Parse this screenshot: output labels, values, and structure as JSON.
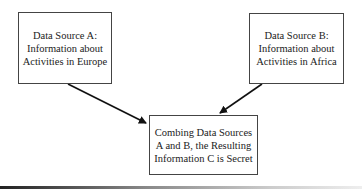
{
  "diagram": {
    "nodes": [
      {
        "id": "A",
        "lines": [
          "Data Source A:",
          "Information about",
          "Activities in Europe"
        ]
      },
      {
        "id": "B",
        "lines": [
          "Data Source B:",
          "Information about",
          "Activities in Africa"
        ]
      },
      {
        "id": "C",
        "lines": [
          "Combing Data Sources",
          "A and B, the Resulting",
          "Information C is Secret"
        ]
      }
    ],
    "edges": [
      {
        "from": "A",
        "to": "C"
      },
      {
        "from": "B",
        "to": "C"
      }
    ],
    "colors": {
      "line": "#111111",
      "border": "#444444",
      "text": "#222222"
    }
  }
}
